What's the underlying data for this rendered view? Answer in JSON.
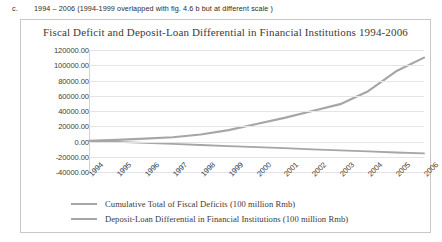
{
  "caption": {
    "marker": "c.",
    "text": "1994 – 2006 (1994-1999 overlapped with fig. 4.6 b but at different scale )"
  },
  "figure": {
    "title": "Fiscal Deficit and Deposit-Loan Differential in Financial Institutions 1994-2006"
  },
  "legend": {
    "items": [
      {
        "label": "Cumulative Total of Fiscal Deficits (100 million Rmb)",
        "color": "#a6a6a6"
      },
      {
        "label": "Deposit-Loan Differential in Financial Institutions (100 million Rmb)",
        "color": "#a6a6a6"
      }
    ]
  },
  "chart_data": {
    "type": "line",
    "title": "Fiscal Deficit and Deposit-Loan Differential in Financial Institutions 1994-2006",
    "xlabel": "",
    "ylabel": "",
    "ylim": [
      -40000,
      120000
    ],
    "ytick_step": 20000,
    "ytick_labels": [
      "120000.00",
      "100000.00",
      "80000.00",
      "60000.00",
      "40000.00",
      "20000.00",
      "0.00",
      "-20000.00",
      "-40000.00"
    ],
    "grid": true,
    "legend_position": "bottom",
    "categories": [
      "1994",
      "1995",
      "1996",
      "1997",
      "1998",
      "1999",
      "2000",
      "2001",
      "2002",
      "2003",
      "2004",
      "2005",
      "2006"
    ],
    "series": [
      {
        "name": "Cumulative Total of Fiscal Deficits (100 million Rmb)",
        "color": "#a6a6a6",
        "values": [
          1000,
          2200,
          3800,
          5600,
          9200,
          15000,
          23000,
          31000,
          40000,
          49000,
          66000,
          92000,
          110000
        ]
      },
      {
        "name": "Deposit-Loan Differential in Financial Institutions (100 million Rmb)",
        "color": "#a6a6a6",
        "values": [
          500,
          -500,
          -1800,
          -3200,
          -4600,
          -6000,
          -7400,
          -8800,
          -10200,
          -11600,
          -13000,
          -14400,
          -15600
        ]
      }
    ]
  }
}
